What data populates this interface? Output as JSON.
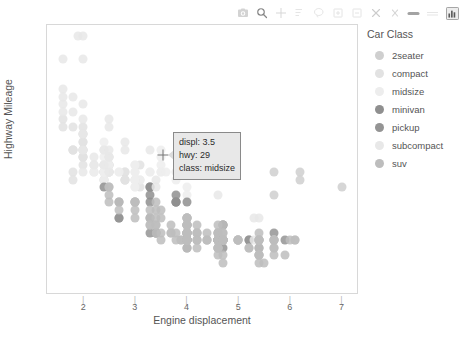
{
  "modebar": {
    "buttons": [
      {
        "name": "camera-icon",
        "label": "Download plot as a png"
      },
      {
        "name": "zoom-icon",
        "label": "Zoom"
      },
      {
        "name": "pan-icon",
        "label": "Pan"
      },
      {
        "name": "zoom-select-box-icon",
        "label": "Box Select"
      },
      {
        "name": "lasso-select-icon",
        "label": "Lasso Select"
      },
      {
        "name": "zoom-in-icon",
        "label": "Zoom in"
      },
      {
        "name": "zoom-out-icon",
        "label": "Zoom out"
      },
      {
        "name": "autoscale-icon",
        "label": "Autoscale"
      },
      {
        "name": "reset-axes-icon",
        "label": "Reset axes"
      },
      {
        "name": "toggle-spike-lines-icon",
        "label": "Toggle Spike Lines"
      },
      {
        "name": "hover-compare-icon",
        "label": "Compare data on hover"
      },
      {
        "name": "plotly-logo-icon",
        "label": "Produced with Plotly"
      }
    ]
  },
  "tooltip": {
    "displ": "displ: 3.5",
    "hwy": "hwy: 29",
    "class": "class: midsize"
  },
  "legend": {
    "title": "Car Class",
    "items": [
      {
        "label": "2seater",
        "color": "#cfcfcf"
      },
      {
        "label": "compact",
        "color": "#e2e2e2"
      },
      {
        "label": "midsize",
        "color": "#ededed"
      },
      {
        "label": "minivan",
        "color": "#8f8f8f"
      },
      {
        "label": "pickup",
        "color": "#949494"
      },
      {
        "label": "subcompact",
        "color": "#e8e8e8"
      },
      {
        "label": "suv",
        "color": "#bdbdbd"
      }
    ]
  },
  "chart_data": {
    "type": "scatter",
    "title": "",
    "xlabel": "Engine displacement",
    "ylabel": "Highway Mileage",
    "xlim": [
      1.3,
      7.3
    ],
    "ylim": [
      10,
      45.5
    ],
    "xticks": [
      2,
      3,
      4,
      5,
      6,
      7
    ],
    "yticks": [
      20,
      30,
      40
    ],
    "grid": false,
    "legend_position": "right",
    "color_by": "class",
    "class_colors": {
      "2seater": "#cfcfcf",
      "compact": "#e2e2e2",
      "midsize": "#ededed",
      "minivan": "#8f8f8f",
      "pickup": "#949494",
      "subcompact": "#e8e8e8",
      "suv": "#bdbdbd"
    },
    "series": [
      {
        "name": "2seater",
        "points": [
          [
            5.7,
            26
          ],
          [
            5.7,
            23
          ],
          [
            6.2,
            26
          ],
          [
            6.2,
            25
          ],
          [
            7.0,
            24
          ]
        ]
      },
      {
        "name": "compact",
        "points": [
          [
            1.8,
            29
          ],
          [
            1.8,
            29
          ],
          [
            2.0,
            31
          ],
          [
            2.0,
            30
          ],
          [
            2.8,
            26
          ],
          [
            2.8,
            26
          ],
          [
            3.1,
            27
          ],
          [
            1.8,
            26
          ],
          [
            1.8,
            25
          ],
          [
            2.0,
            28
          ],
          [
            2.0,
            27
          ],
          [
            2.8,
            25
          ],
          [
            2.8,
            25
          ],
          [
            3.1,
            25
          ],
          [
            3.1,
            24
          ],
          [
            2.4,
            27
          ],
          [
            2.4,
            26
          ],
          [
            2.4,
            26
          ],
          [
            2.4,
            25
          ],
          [
            2.5,
            26
          ],
          [
            2.5,
            27
          ],
          [
            3.3,
            24
          ],
          [
            2.0,
            31
          ],
          [
            2.0,
            32
          ],
          [
            2.4,
            27
          ],
          [
            2.4,
            26
          ],
          [
            2.0,
            29
          ],
          [
            2.0,
            29
          ],
          [
            2.5,
            28
          ],
          [
            2.5,
            27
          ],
          [
            2.2,
            27
          ],
          [
            2.2,
            26
          ],
          [
            2.4,
            26
          ],
          [
            2.4,
            25
          ],
          [
            2.0,
            28
          ],
          [
            2.0,
            28
          ],
          [
            2.5,
            26
          ],
          [
            2.5,
            27
          ],
          [
            1.6,
            33
          ],
          [
            1.6,
            32
          ],
          [
            1.8,
            29
          ],
          [
            1.8,
            32
          ],
          [
            2.0,
            29
          ],
          [
            2.0,
            30
          ],
          [
            2.5,
            26
          ],
          [
            2.8,
            25
          ]
        ]
      },
      {
        "name": "midsize",
        "points": [
          [
            2.4,
            26
          ],
          [
            3.0,
            24
          ],
          [
            3.0,
            25
          ],
          [
            3.5,
            29
          ],
          [
            2.4,
            27
          ],
          [
            2.4,
            26
          ],
          [
            3.1,
            25
          ],
          [
            3.5,
            28
          ],
          [
            2.4,
            27
          ],
          [
            2.4,
            26
          ],
          [
            3.0,
            26
          ],
          [
            3.0,
            25
          ],
          [
            3.5,
            27
          ],
          [
            2.2,
            26
          ],
          [
            2.2,
            27
          ],
          [
            2.4,
            26
          ],
          [
            2.4,
            25
          ],
          [
            3.0,
            25
          ],
          [
            3.0,
            24
          ],
          [
            3.3,
            24
          ],
          [
            2.5,
            27
          ],
          [
            2.5,
            26
          ],
          [
            3.0,
            26
          ],
          [
            3.0,
            25
          ],
          [
            3.5,
            26
          ],
          [
            3.8,
            25
          ],
          [
            2.7,
            26
          ],
          [
            2.7,
            26
          ],
          [
            3.0,
            27
          ],
          [
            3.0,
            27
          ],
          [
            3.5,
            26
          ],
          [
            3.6,
            26
          ],
          [
            2.4,
            28
          ],
          [
            2.4,
            29
          ],
          [
            3.3,
            26
          ],
          [
            3.3,
            26
          ],
          [
            4.0,
            24
          ],
          [
            4.0,
            23
          ],
          [
            2.4,
            30
          ],
          [
            2.4,
            29
          ]
        ]
      },
      {
        "name": "minivan",
        "points": [
          [
            2.4,
            24
          ],
          [
            3.0,
            22
          ],
          [
            3.3,
            22
          ],
          [
            3.3,
            24
          ],
          [
            3.8,
            22
          ],
          [
            3.8,
            22
          ],
          [
            3.8,
            23
          ],
          [
            3.8,
            22
          ],
          [
            3.3,
            23
          ],
          [
            3.3,
            24
          ],
          [
            4.0,
            22
          ]
        ]
      },
      {
        "name": "pickup",
        "points": [
          [
            4.7,
            17
          ],
          [
            5.2,
            17
          ],
          [
            5.7,
            18
          ],
          [
            5.9,
            17
          ],
          [
            4.7,
            19
          ],
          [
            4.7,
            19
          ],
          [
            4.7,
            17
          ],
          [
            5.2,
            17
          ],
          [
            3.3,
            20
          ],
          [
            3.3,
            18
          ],
          [
            4.0,
            18
          ],
          [
            4.0,
            17
          ],
          [
            4.0,
            17
          ],
          [
            4.6,
            17
          ],
          [
            4.6,
            17
          ],
          [
            4.6,
            17
          ],
          [
            5.4,
            16
          ],
          [
            5.4,
            17
          ],
          [
            4.0,
            19
          ],
          [
            4.0,
            20
          ],
          [
            4.0,
            18
          ],
          [
            4.0,
            17
          ],
          [
            4.6,
            18
          ],
          [
            4.6,
            17
          ],
          [
            5.0,
            17
          ],
          [
            2.7,
            20
          ],
          [
            2.7,
            20
          ],
          [
            2.7,
            22
          ],
          [
            3.4,
            18
          ],
          [
            3.4,
            18
          ],
          [
            4.0,
            17
          ],
          [
            4.0,
            16
          ],
          [
            4.7,
            16
          ]
        ]
      },
      {
        "name": "subcompact",
        "points": [
          [
            2.0,
            33
          ],
          [
            2.0,
            35
          ],
          [
            2.5,
            33
          ],
          [
            2.5,
            32
          ],
          [
            2.8,
            30
          ],
          [
            2.8,
            29
          ],
          [
            3.3,
            29
          ],
          [
            1.6,
            35
          ],
          [
            1.6,
            37
          ],
          [
            1.6,
            34
          ],
          [
            1.6,
            36
          ],
          [
            1.6,
            41
          ],
          [
            1.8,
            36
          ],
          [
            1.8,
            34
          ],
          [
            2.0,
            31
          ],
          [
            2.4,
            29
          ],
          [
            2.4,
            27
          ],
          [
            3.8,
            26
          ],
          [
            4.0,
            26
          ],
          [
            4.6,
            23
          ],
          [
            5.4,
            20
          ],
          [
            2.2,
            28
          ],
          [
            2.2,
            27
          ],
          [
            2.5,
            28
          ],
          [
            2.5,
            26
          ],
          [
            3.4,
            25
          ],
          [
            3.4,
            24
          ],
          [
            1.9,
            44
          ],
          [
            2.0,
            44
          ],
          [
            2.0,
            41
          ],
          [
            2.0,
            29
          ],
          [
            2.0,
            26
          ],
          [
            2.5,
            28
          ],
          [
            2.5,
            29
          ],
          [
            5.3,
            20
          ],
          [
            5.3,
            17
          ],
          [
            5.7,
            17
          ]
        ]
      },
      {
        "name": "suv",
        "points": [
          [
            4.2,
            17
          ],
          [
            4.2,
            17
          ],
          [
            4.6,
            16
          ],
          [
            4.6,
            17
          ],
          [
            4.6,
            17
          ],
          [
            4.6,
            16
          ],
          [
            5.4,
            17
          ],
          [
            5.4,
            17
          ],
          [
            5.4,
            15
          ],
          [
            4.0,
            19
          ],
          [
            4.0,
            20
          ],
          [
            4.0,
            18
          ],
          [
            4.0,
            17
          ],
          [
            4.6,
            18
          ],
          [
            4.6,
            17
          ],
          [
            5.0,
            17
          ],
          [
            4.2,
            17
          ],
          [
            4.2,
            18
          ],
          [
            4.4,
            17
          ],
          [
            4.6,
            17
          ],
          [
            5.4,
            14
          ],
          [
            5.4,
            15
          ],
          [
            3.7,
            19
          ],
          [
            3.7,
            18
          ],
          [
            3.9,
            17
          ],
          [
            3.9,
            17
          ],
          [
            4.7,
            17
          ],
          [
            4.7,
            17
          ],
          [
            4.7,
            17
          ],
          [
            5.2,
            16
          ],
          [
            5.2,
            16
          ],
          [
            5.7,
            17
          ],
          [
            5.9,
            15
          ],
          [
            4.6,
            19
          ],
          [
            5.4,
            18
          ],
          [
            5.4,
            17
          ],
          [
            4.0,
            19
          ],
          [
            4.0,
            18
          ],
          [
            4.0,
            17
          ],
          [
            4.0,
            17
          ],
          [
            4.6,
            16
          ],
          [
            5.0,
            17
          ],
          [
            4.2,
            18
          ],
          [
            4.4,
            18
          ],
          [
            4.6,
            16
          ],
          [
            5.4,
            15
          ],
          [
            3.0,
            22
          ],
          [
            3.7,
            18
          ],
          [
            4.0,
            18
          ],
          [
            4.7,
            18
          ],
          [
            4.7,
            17
          ],
          [
            5.7,
            17
          ],
          [
            6.1,
            17
          ],
          [
            4.0,
            19
          ],
          [
            4.2,
            19
          ],
          [
            4.4,
            17
          ],
          [
            4.6,
            17
          ],
          [
            5.4,
            17
          ],
          [
            5.4,
            16
          ],
          [
            4.0,
            20
          ],
          [
            4.0,
            18
          ],
          [
            4.6,
            18
          ],
          [
            5.0,
            17
          ],
          [
            4.2,
            18
          ],
          [
            4.4,
            17
          ],
          [
            4.6,
            17
          ],
          [
            5.4,
            15
          ],
          [
            2.5,
            23
          ],
          [
            2.5,
            24
          ],
          [
            3.4,
            22
          ],
          [
            3.4,
            21
          ],
          [
            4.0,
            20
          ],
          [
            4.7,
            19
          ],
          [
            4.7,
            18
          ],
          [
            4.7,
            17
          ],
          [
            5.7,
            17
          ],
          [
            6.1,
            17
          ],
          [
            3.0,
            22
          ],
          [
            3.3,
            21
          ],
          [
            3.3,
            19
          ],
          [
            4.0,
            19
          ],
          [
            4.0,
            18
          ],
          [
            4.7,
            17
          ],
          [
            5.7,
            16
          ],
          [
            2.7,
            22
          ],
          [
            2.7,
            21
          ],
          [
            3.4,
            20
          ],
          [
            3.4,
            19
          ],
          [
            4.0,
            18
          ],
          [
            4.0,
            17
          ],
          [
            4.7,
            17
          ],
          [
            5.7,
            17
          ],
          [
            6.0,
            17
          ],
          [
            3.0,
            21
          ],
          [
            3.0,
            20
          ],
          [
            3.3,
            19
          ],
          [
            3.3,
            20
          ],
          [
            3.5,
            18
          ],
          [
            3.5,
            17
          ],
          [
            3.8,
            18
          ],
          [
            3.8,
            17
          ],
          [
            4.0,
            17
          ],
          [
            4.0,
            16
          ],
          [
            4.2,
            16
          ],
          [
            4.6,
            15
          ],
          [
            4.6,
            16
          ],
          [
            4.7,
            15
          ],
          [
            5.5,
            14
          ],
          [
            4.7,
            14
          ],
          [
            5.7,
            15
          ],
          [
            2.5,
            24
          ],
          [
            2.5,
            22
          ],
          [
            3.5,
            21
          ],
          [
            3.5,
            20
          ],
          [
            4.0,
            19
          ],
          [
            4.7,
            17
          ],
          [
            5.7,
            16
          ],
          [
            3.4,
            19
          ],
          [
            3.4,
            18
          ]
        ]
      }
    ]
  }
}
